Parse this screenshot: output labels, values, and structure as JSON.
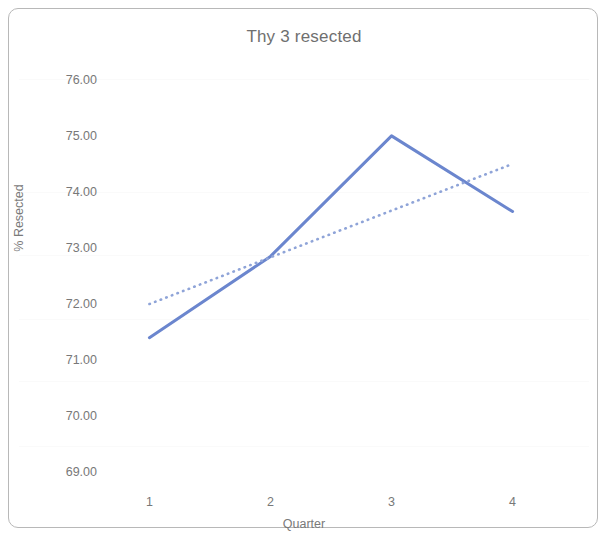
{
  "chart_data": {
    "type": "line",
    "title": "Thy 3 resected",
    "xlabel": "Quarter",
    "ylabel": "% Resected",
    "categories": [
      "1",
      "2",
      "3",
      "4"
    ],
    "x": [
      1,
      2,
      3,
      4
    ],
    "xlim": [
      0.6,
      4.4
    ],
    "ylim": [
      68.7,
      76.3
    ],
    "yticks": [
      "69.00",
      "70.00",
      "71.00",
      "72.00",
      "73.00",
      "74.00",
      "75.00",
      "76.00"
    ],
    "ytick_values": [
      69,
      70,
      71,
      72,
      73,
      74,
      75,
      76
    ],
    "xticks": [
      "1",
      "2",
      "3",
      "4"
    ],
    "grid": false,
    "legend": "none",
    "series": [
      {
        "name": "% Resected",
        "style": "solid",
        "color": "#6b86ce",
        "values": [
          71.4,
          72.85,
          75.0,
          73.65
        ]
      },
      {
        "name": "Linear trendline",
        "style": "dotted",
        "color": "#8fa4d8",
        "x": [
          1,
          4
        ],
        "values": [
          72.0,
          74.5
        ]
      }
    ]
  },
  "figure": {
    "title": "Thy 3 resected",
    "frame_color": "#b8b8b8",
    "background": "#ffffff",
    "text_color": "#787878"
  }
}
